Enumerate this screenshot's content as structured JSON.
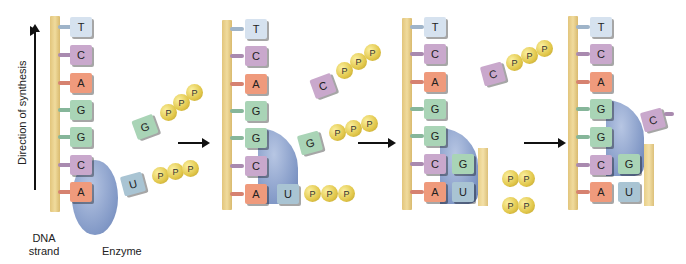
{
  "labels": {
    "direction": "Direction of synthesis",
    "dna_strand_line1": "DNA",
    "dna_strand_line2": "strand",
    "enzyme": "Enzyme"
  },
  "template_sequence": [
    "T",
    "C",
    "A",
    "G",
    "G",
    "C",
    "A"
  ],
  "phosphate_label": "P",
  "panels": [
    {
      "incoming": [
        {
          "base": "G",
          "phosphates": 3
        },
        {
          "base": "U",
          "phosphates": 3
        }
      ],
      "synthesized": []
    },
    {
      "incoming": [
        {
          "base": "C",
          "phosphates": 3
        },
        {
          "base": "G",
          "phosphates": 3
        }
      ],
      "synthesized": [
        "U"
      ]
    },
    {
      "incoming": [
        {
          "base": "C",
          "phosphates": 3
        }
      ],
      "synthesized": [
        "G",
        "U"
      ],
      "released": [
        "PP",
        "PP"
      ]
    },
    {
      "incoming": [
        {
          "base": "C",
          "phosphates": 0
        }
      ],
      "synthesized": [
        "G",
        "G",
        "U"
      ]
    }
  ],
  "colors": {
    "T": "#d6e2ef",
    "C": "#c9a8cc",
    "A": "#ef9a7c",
    "G": "#a9d4b6",
    "U": "#a9c4d3",
    "strand": "#e8cf88",
    "enzyme": "#8198c6",
    "phosphate": "#e1c649"
  }
}
